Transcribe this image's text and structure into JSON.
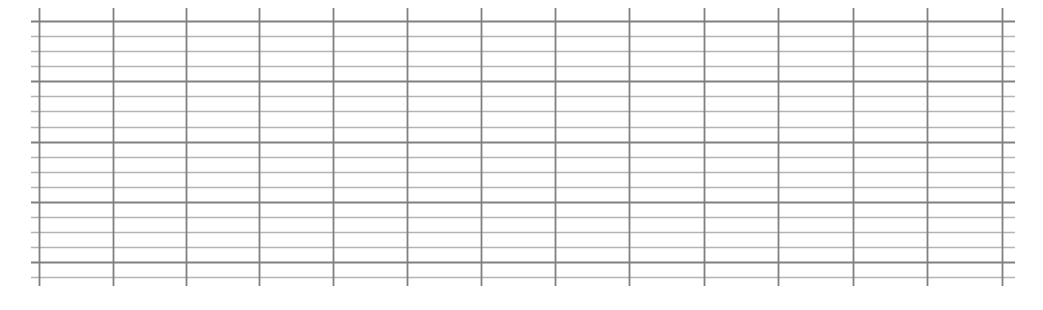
{
  "grid": {
    "colors": {
      "major": "#808080",
      "minor": "#b4b4b4",
      "background": "#ffffff"
    },
    "horizontal": {
      "x_start": 31,
      "x_end": 1015,
      "major_y": [
        21,
        81,
        142,
        202,
        262
      ],
      "minor_y": [
        36,
        51,
        66,
        96,
        111,
        127,
        157,
        172,
        187,
        217,
        232,
        247,
        277
      ]
    },
    "vertical": {
      "y_start": 8,
      "y_end": 286,
      "x": [
        39,
        113,
        186,
        259,
        333,
        407,
        481,
        555,
        629,
        704,
        778,
        853,
        927,
        1002
      ]
    }
  }
}
